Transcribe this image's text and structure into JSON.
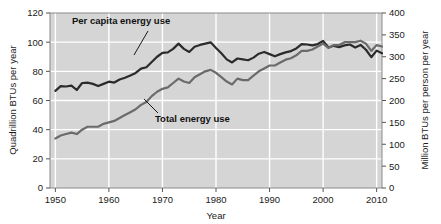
{
  "chart_data": {
    "type": "line",
    "title": "",
    "xlabel": "Year",
    "ylabel": "Quadrillion BTUs per year",
    "ylabel_right": "Million BTUs per person per year",
    "xlim": [
      1949,
      2011
    ],
    "ylim": [
      0,
      120
    ],
    "ylim_right": [
      0,
      400
    ],
    "xticks": [
      1950,
      1960,
      1970,
      1980,
      1990,
      2000,
      2010
    ],
    "xtick_labels": [
      "1950",
      "1960",
      "1970",
      "1980",
      "1990",
      "2000",
      "2010"
    ],
    "yticks": [
      0,
      20,
      40,
      60,
      80,
      100,
      120
    ],
    "ytick_labels": [
      "0",
      "20",
      "40",
      "60",
      "80",
      "100",
      "120"
    ],
    "yticks_right": [
      0,
      50,
      100,
      150,
      200,
      250,
      300,
      350,
      400
    ],
    "ytick_labels_right": [
      "0",
      "50",
      "100",
      "150",
      "200",
      "250",
      "300",
      "350",
      "400"
    ],
    "grid": true,
    "grid_color": "#ffffff",
    "plot_background": "#d5d5d5",
    "legend_position": "inline-annotation",
    "series": [
      {
        "name": "Per capita energy use",
        "axis": "right",
        "units": "Million BTUs per person per year",
        "color": "#2b2b2b",
        "x": [
          1950,
          1951,
          1952,
          1953,
          1954,
          1955,
          1956,
          1957,
          1958,
          1959,
          1960,
          1961,
          1962,
          1963,
          1964,
          1965,
          1966,
          1967,
          1968,
          1969,
          1970,
          1971,
          1972,
          1973,
          1974,
          1975,
          1976,
          1977,
          1978,
          1979,
          1980,
          1981,
          1982,
          1983,
          1984,
          1985,
          1986,
          1987,
          1988,
          1989,
          1990,
          1991,
          1992,
          1993,
          1994,
          1995,
          1996,
          1997,
          1998,
          1999,
          2000,
          2001,
          2002,
          2003,
          2004,
          2005,
          2006,
          2007,
          2008,
          2009,
          2010,
          2011
        ],
        "values": [
          222,
          233,
          232,
          234,
          224,
          240,
          241,
          238,
          233,
          238,
          243,
          241,
          248,
          252,
          257,
          263,
          273,
          276,
          288,
          300,
          309,
          310,
          318,
          330,
          318,
          311,
          323,
          327,
          330,
          333,
          320,
          308,
          294,
          287,
          296,
          294,
          292,
          298,
          307,
          311,
          306,
          301,
          306,
          310,
          313,
          319,
          329,
          328,
          326,
          329,
          336,
          321,
          325,
          322,
          326,
          328,
          321,
          327,
          316,
          299,
          314,
          308
        ]
      },
      {
        "name": "Total energy use",
        "axis": "left",
        "units": "Quadrillion BTUs per year",
        "color": "#6b6b6b",
        "x": [
          1950,
          1951,
          1952,
          1953,
          1954,
          1955,
          1956,
          1957,
          1958,
          1959,
          1960,
          1961,
          1962,
          1963,
          1964,
          1965,
          1966,
          1967,
          1968,
          1969,
          1970,
          1971,
          1972,
          1973,
          1974,
          1975,
          1976,
          1977,
          1978,
          1979,
          1980,
          1981,
          1982,
          1983,
          1984,
          1985,
          1986,
          1987,
          1988,
          1989,
          1990,
          1991,
          1992,
          1993,
          1994,
          1995,
          1996,
          1997,
          1998,
          1999,
          2000,
          2001,
          2002,
          2003,
          2004,
          2005,
          2006,
          2007,
          2008,
          2009,
          2010,
          2011
        ],
        "values": [
          34,
          36,
          37,
          38,
          37,
          40,
          42,
          42,
          42,
          44,
          45,
          46,
          48,
          50,
          52,
          54,
          57,
          59,
          63,
          66,
          68,
          69,
          72,
          75,
          73,
          72,
          76,
          78,
          80,
          81,
          79,
          76,
          73,
          71,
          75,
          74,
          74,
          77,
          80,
          82,
          84,
          84,
          86,
          88,
          89,
          91,
          94,
          94,
          95,
          97,
          99,
          96,
          98,
          98,
          100,
          100,
          100,
          101,
          99,
          94,
          98,
          97
        ]
      }
    ],
    "annotations": [
      {
        "name": "per-capita-label",
        "text": "Per capita energy use",
        "x_px": 72,
        "y_px": 24
      },
      {
        "name": "total-label",
        "text": "Total energy use",
        "x_px": 155,
        "y_px": 122
      }
    ]
  }
}
